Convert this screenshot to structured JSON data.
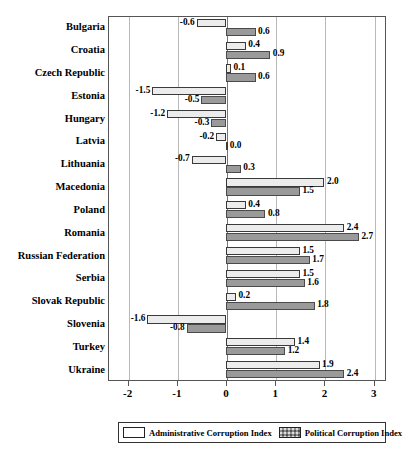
{
  "chart_data": {
    "type": "bar",
    "orientation": "horizontal",
    "title": "",
    "xlabel": "",
    "ylabel": "",
    "xlim": [
      -2.4,
      3.25
    ],
    "grid": true,
    "legend_position": "bottom",
    "categories": [
      "Bulgaria",
      "Croatia",
      "Czech Republic",
      "Estonia",
      "Hungary",
      "Latvia",
      "Lithuania",
      "Macedonia",
      "Poland",
      "Romania",
      "Russian Federation",
      "Serbia",
      "Slovak Republic",
      "Slovenia",
      "Turkey",
      "Ukraine"
    ],
    "series": [
      {
        "name": "Administrative Corruption Index",
        "key": "admin",
        "color": "#ececec",
        "values": [
          -0.6,
          0.4,
          0.1,
          -1.5,
          -1.2,
          -0.2,
          -0.7,
          2.0,
          0.4,
          2.4,
          1.5,
          1.5,
          0.2,
          -1.6,
          1.4,
          1.9
        ],
        "labels": [
          "-0.6",
          "0.4",
          "0.1",
          "-1.5",
          "-1.2",
          "-0.2",
          "-0.7",
          "2.0",
          "0.4",
          "2.4",
          "1.5",
          "1.5",
          "0.2",
          "-1.6",
          "1.4",
          "1.9"
        ]
      },
      {
        "name": "Political Corruption Index",
        "key": "political",
        "color": "#9a9a9a",
        "values": [
          0.6,
          0.9,
          0.6,
          -0.5,
          -0.3,
          0.0,
          0.3,
          1.5,
          0.8,
          2.7,
          1.7,
          1.6,
          1.8,
          -0.8,
          1.2,
          2.4
        ],
        "labels": [
          "0.6",
          "0.9",
          "0.6",
          "-0.5",
          "-0.3",
          "0.0",
          "0.3",
          "1.5",
          "0.8",
          "2.7",
          "1.7",
          "1.6",
          "1.8",
          "-0.8",
          "1.2",
          "2.4"
        ]
      }
    ],
    "xticks": [
      -2,
      -1,
      0,
      1,
      2,
      3
    ],
    "xtick_labels": [
      "-2",
      "-1",
      "0",
      "1",
      "2",
      "3"
    ]
  },
  "legend": {
    "entries": [
      {
        "label": "Administrative Corruption Index",
        "swatch": "admin"
      },
      {
        "label": "Political Corruption Index",
        "swatch": "political"
      }
    ]
  }
}
